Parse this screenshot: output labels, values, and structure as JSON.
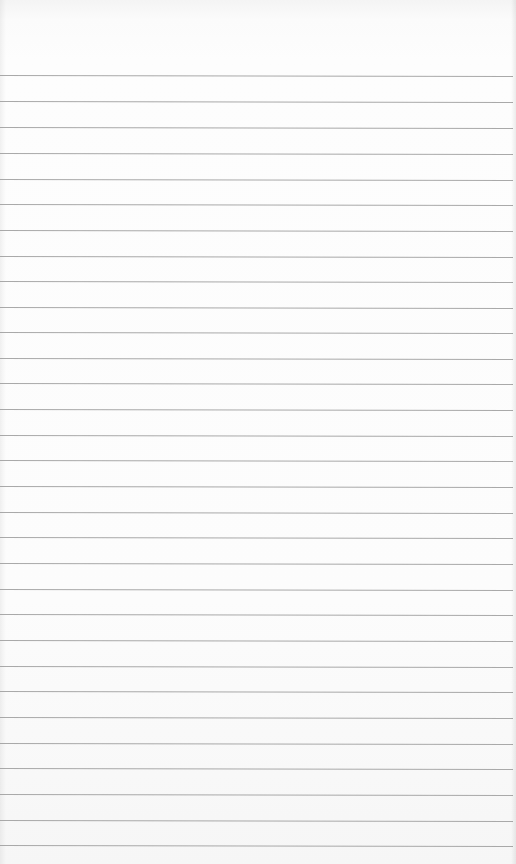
{
  "page": {
    "type": "lined-paper",
    "background_color": "#fcfcfc",
    "line_color": "#a0a0a0",
    "line_count": 31,
    "line_y_positions": [
      75,
      101,
      127,
      153,
      179,
      204,
      230,
      256,
      281,
      307,
      332,
      358,
      383,
      409,
      435,
      460,
      486,
      512,
      537,
      563,
      589,
      614,
      640,
      666,
      691,
      717,
      743,
      768,
      794,
      820,
      845
    ],
    "text": ""
  }
}
